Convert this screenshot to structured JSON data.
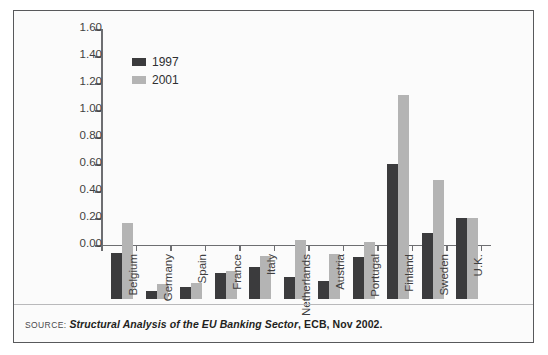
{
  "chart_data": {
    "type": "bar",
    "title": "",
    "xlabel": "",
    "ylabel": "",
    "ylim": [
      0,
      1.6
    ],
    "ytick_step": 0.2,
    "grid": false,
    "legend_position": "top-left",
    "categories": [
      "Belgium",
      "Germany",
      "Spain",
      "France",
      "Italy",
      "Netherlands",
      "Austria",
      "Portugal",
      "Finland",
      "Sweden",
      "U.K."
    ],
    "ytick_labels": [
      "0.00",
      "0.20",
      "0.40",
      "0.60",
      "0.80",
      "1.00",
      "1.20",
      "1.40",
      "1.60"
    ],
    "ytick_values": [
      0.0,
      0.2,
      0.4,
      0.6,
      0.8,
      1.0,
      1.2,
      1.4,
      1.6
    ],
    "series": [
      {
        "name": "1997",
        "color": "#3b3b3d",
        "values": [
          0.34,
          0.06,
          0.09,
          0.195,
          0.24,
          0.16,
          0.13,
          0.31,
          1.0,
          0.49,
          0.6
        ]
      },
      {
        "name": "2001",
        "color": "#b4b4b4",
        "values": [
          0.56,
          0.11,
          0.12,
          0.205,
          0.32,
          0.44,
          0.33,
          0.42,
          1.51,
          0.88,
          0.6
        ]
      }
    ]
  },
  "legend": {
    "items": [
      {
        "label": "1997",
        "color": "#3b3b3d"
      },
      {
        "label": "2001",
        "color": "#b4b4b4"
      }
    ]
  },
  "source": {
    "keyword": "SOURCE:",
    "title": "Structural Analysis of the EU Banking Sector",
    "rest": ", ECB, Nov 2002."
  },
  "colors": {
    "frame": "#58595b",
    "axis": "#6d6e71",
    "series_1997": "#3b3b3d",
    "series_2001": "#b4b4b4",
    "background": "#fbfbfb"
  }
}
